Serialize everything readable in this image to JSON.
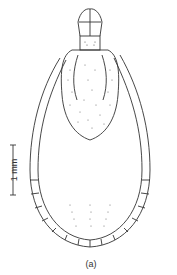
{
  "figure": {
    "scale_bar": {
      "label": "1 mm"
    },
    "caption": "(a)",
    "colors": {
      "line": "#333333",
      "background": "#ffffff"
    }
  }
}
